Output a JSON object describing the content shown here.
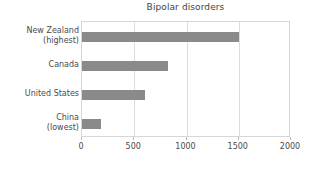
{
  "chart_data": {
    "type": "bar",
    "orientation": "horizontal",
    "title": "Bipolar disorders",
    "xlabel": "",
    "ylabel": "",
    "categories": [
      "New Zealand (highest)",
      "Canada",
      "United States",
      "China (lowest)"
    ],
    "category_lines": [
      [
        "New Zealand",
        "(highest)"
      ],
      [
        "Canada",
        ""
      ],
      [
        "United States",
        ""
      ],
      [
        "China",
        "(lowest)"
      ]
    ],
    "values": [
      1500,
      820,
      600,
      180
    ],
    "xlim": [
      0,
      2000
    ],
    "xticks": [
      0,
      500,
      1000,
      1500,
      2000
    ],
    "xtick_labels": [
      "0",
      "500",
      "1000",
      "1500",
      "2000"
    ],
    "grid": "vertical",
    "legend": "none",
    "bar_color": "#8a8a8a",
    "text_color": "#4a4a4a",
    "grid_color": "#dcdcdc",
    "frame_color": "#d6d6d6"
  }
}
